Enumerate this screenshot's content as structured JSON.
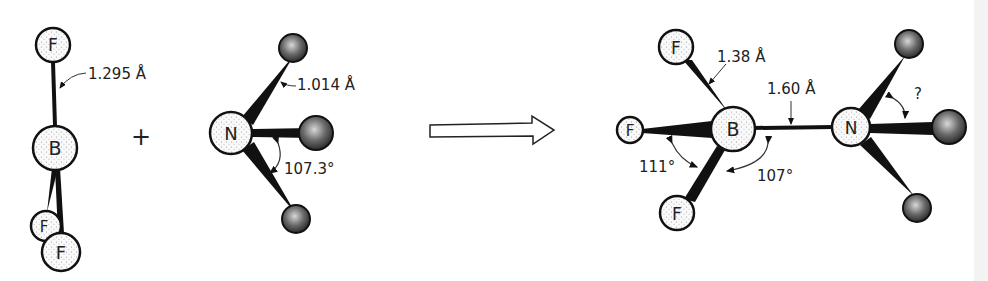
{
  "reactants": {
    "bf3": {
      "atoms": [
        {
          "label": "F"
        },
        {
          "label": "B"
        },
        {
          "label": "F"
        },
        {
          "label": "F"
        }
      ],
      "bond_length": "1.295 Å"
    },
    "plus": "+",
    "nh3": {
      "atoms": [
        {
          "label": "N"
        }
      ],
      "bond_length": "1.014 Å",
      "bond_angle": "107.3°"
    }
  },
  "product": {
    "atoms": [
      {
        "label": "F"
      },
      {
        "label": "F"
      },
      {
        "label": "B"
      },
      {
        "label": "F"
      },
      {
        "label": "N"
      }
    ],
    "bf_bond_length": "1.38 Å",
    "bn_bond_length": "1.60 Å",
    "fbf_angle": "111°",
    "fbn_angle": "107°",
    "hnh_angle": "?"
  },
  "colors": {
    "stroke": "#111111",
    "dark_atom": "#3a3a3a",
    "light_atom": "#f4f4f4"
  }
}
